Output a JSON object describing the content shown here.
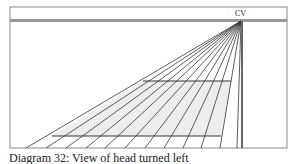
{
  "diagram": {
    "label_cv": "CV",
    "caption": "Diagram 32: View of head turned left",
    "frame": {
      "x": 10,
      "y": 7,
      "w": 277,
      "h": 141
    },
    "horizon": {
      "y": 20
    },
    "vanishing_point": {
      "x": 241,
      "y": 21
    },
    "ray_ends_x": [
      26,
      46,
      66,
      86,
      105,
      125,
      145,
      164,
      183,
      201,
      220,
      237
    ],
    "ray_bottom_y": 148,
    "cross_lines": [
      {
        "y": 81,
        "x1": 143,
        "x2": 231
      },
      {
        "y": 136,
        "x1": 52,
        "x2": 221
      }
    ],
    "colors": {
      "line": "#333333",
      "shade": "#ececec",
      "frame": "#777777"
    }
  }
}
